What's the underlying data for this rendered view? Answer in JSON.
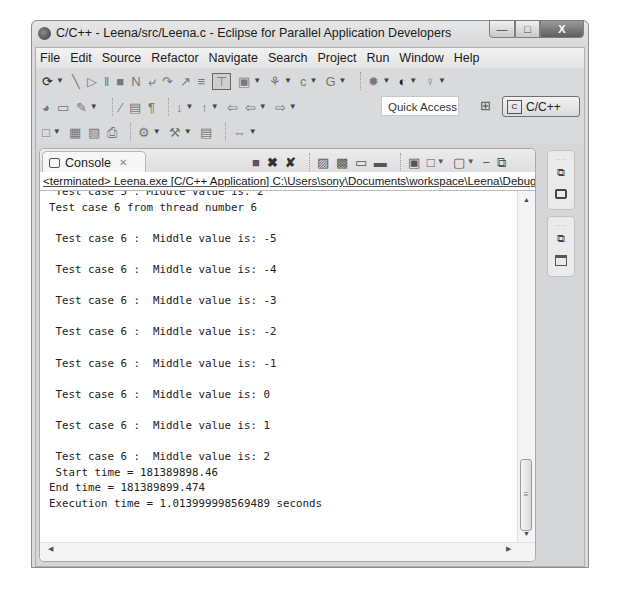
{
  "window": {
    "title": "C/C++ - Leena/src/Leena.c - Eclipse for Parallel Application Developers",
    "controls": {
      "minimize": "—",
      "maximize": "□",
      "close": "X"
    }
  },
  "menubar": {
    "items": [
      "File",
      "Edit",
      "Source",
      "Refactor",
      "Navigate",
      "Search",
      "Project",
      "Run",
      "Window",
      "Help"
    ]
  },
  "toolbar": {
    "quick_access_placeholder": "Quick Access",
    "perspective_label": "C/C++"
  },
  "console": {
    "tab_label": "Console",
    "tab_close": "✕",
    "status": "<terminated> Leena.exe [C/C++ Application] C:\\Users\\sony\\Documents\\workspace\\Leena\\Debug\\",
    "lines": [
      " Test case 5 : Middle value is: 2",
      "Test case 6 from thread number 6",
      "",
      " Test case 6 :  Middle value is: -5",
      "",
      " Test case 6 :  Middle value is: -4",
      "",
      " Test case 6 :  Middle value is: -3",
      "",
      " Test case 6 :  Middle value is: -2",
      "",
      " Test case 6 :  Middle value is: -1",
      "",
      " Test case 6 :  Middle value is: 0",
      "",
      " Test case 6 :  Middle value is: 1",
      "",
      " Test case 6 :  Middle value is: 2",
      " Start time = 181389898.46",
      "End time = 181389899.474",
      "Execution time = 1.013999998569489 seconds"
    ]
  }
}
